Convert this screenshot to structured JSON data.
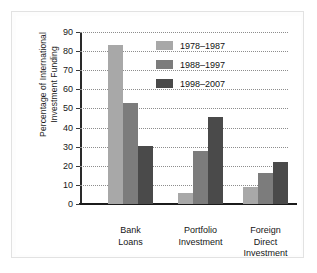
{
  "chart_data": {
    "type": "bar",
    "title": "",
    "xlabel": "",
    "ylabel": "Percentage of International Investment Funding",
    "ylabel_lines": [
      "Percentage of International",
      "Investment Funding"
    ],
    "categories": [
      "Bank Loans",
      "Portfolio Investment",
      "Foreign Direct Investment"
    ],
    "category_lines": [
      [
        "Bank",
        "Loans"
      ],
      [
        "Portfolio",
        "Investment"
      ],
      [
        "Foreign",
        "Direct",
        "Investment"
      ]
    ],
    "series": [
      {
        "name": "1978–1987",
        "values": [
          83,
          6,
          9
        ],
        "color": "#a8a8a8"
      },
      {
        "name": "1988–1997",
        "values": [
          53,
          28,
          16
        ],
        "color": "#7c7c7c"
      },
      {
        "name": "1998–2007",
        "values": [
          30.5,
          45.5,
          22
        ],
        "color": "#4a4a4a"
      }
    ],
    "ylim": [
      0,
      90
    ],
    "yticks": [
      0,
      10,
      20,
      30,
      40,
      50,
      60,
      70,
      80,
      90
    ],
    "ytick_labels": [
      "0",
      "10",
      "20",
      "30",
      "40",
      "50",
      "60",
      "70",
      "80",
      "90"
    ],
    "grid": true,
    "grid_style": "dotted",
    "legend_position": "top-right",
    "axis_color": "#1b1b1b",
    "background_color": "#ffffff"
  }
}
